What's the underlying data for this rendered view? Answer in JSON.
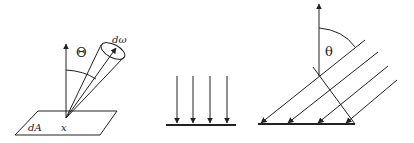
{
  "figure": {
    "panels": [
      {
        "id": "solid-angle",
        "labels": {
          "angle": "Θ",
          "solid_angle": "dω",
          "area": "dA",
          "point": "x"
        }
      },
      {
        "id": "normal-incidence",
        "arrow_count": 4
      },
      {
        "id": "oblique-incidence",
        "labels": {
          "angle": "θ"
        },
        "ray_count": 4
      }
    ],
    "colors": {
      "stroke": "#222222",
      "background": "#ffffff"
    }
  }
}
